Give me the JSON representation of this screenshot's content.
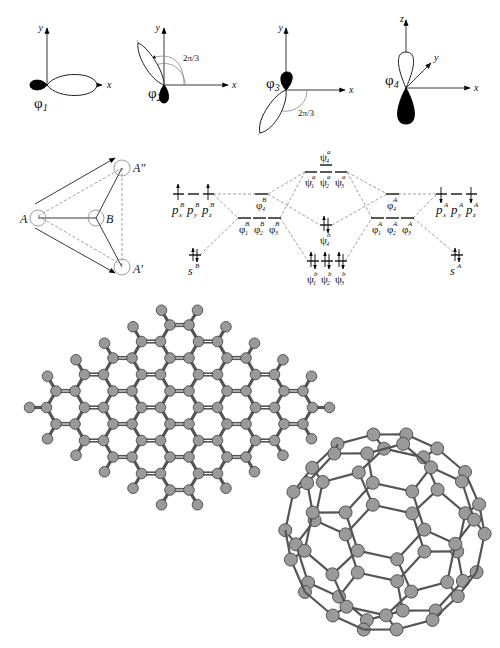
{
  "figure": {
    "panels": {
      "orbitals": {
        "items": [
          {
            "label": "φ",
            "sub": "1",
            "axes": [
              "x",
              "y"
            ],
            "angle_label": ""
          },
          {
            "label": "φ",
            "sub": "2",
            "axes": [
              "x",
              "y"
            ],
            "angle_label": "2π/3"
          },
          {
            "label": "φ",
            "sub": "3",
            "axes": [
              "x",
              "y"
            ],
            "angle_label": "2π/3"
          },
          {
            "label": "φ",
            "sub": "4",
            "axes": [
              "x",
              "y",
              "z"
            ],
            "angle_label": ""
          }
        ]
      },
      "geometry": {
        "atoms": [
          {
            "label": "A"
          },
          {
            "label": "B"
          },
          {
            "label": "A′"
          },
          {
            "label": "A″"
          }
        ]
      },
      "mo_diagram": {
        "levels": {
          "p_B": {
            "labels": [
              "p",
              "p",
              "p"
            ],
            "subs": [
              "x",
              "y",
              "z"
            ],
            "sup": "B"
          },
          "s_B": {
            "label": "s",
            "sup": "B"
          },
          "phi4_B": {
            "label": "φ",
            "sub": "4",
            "sup": "B"
          },
          "phi123_B": {
            "label": "φ",
            "subs": [
              "1",
              "2",
              "3"
            ],
            "sup": "B"
          },
          "psi4_a": {
            "label": "ψ",
            "sub": "4",
            "sup": "a"
          },
          "psi123_a": {
            "label": "ψ",
            "subs": [
              "1",
              "2",
              "3"
            ],
            "sup": "a"
          },
          "psi4_b": {
            "label": "ψ",
            "sub": "4",
            "sup": "b"
          },
          "psi123_b": {
            "label": "ψ",
            "subs": [
              "1",
              "2",
              "3"
            ],
            "sup": "b"
          },
          "phi4_A": {
            "label": "φ",
            "sub": "4",
            "sup": "A"
          },
          "phi123_A": {
            "label": "φ",
            "subs": [
              "1",
              "2",
              "3"
            ],
            "sup": "A"
          },
          "p_A": {
            "labels": [
              "p",
              "p",
              "p"
            ],
            "subs": [
              "x",
              "y",
              "z"
            ],
            "sup": "A"
          },
          "s_A": {
            "label": "s",
            "sup": "A"
          }
        }
      },
      "graphene_flake": {
        "description": "armchair hexagonal carbon flake with hydrogen termination",
        "rhombus_size": 5
      },
      "fullerene": {
        "description": "C60 buckminsterfullerene ball-and-stick model",
        "atoms": 60
      }
    },
    "colors": {
      "atom_fill": "#9a9a9a",
      "atom_stroke": "#3a3a3a",
      "bond": "#555555",
      "ink": "#000000",
      "dashed": "#888888"
    }
  }
}
